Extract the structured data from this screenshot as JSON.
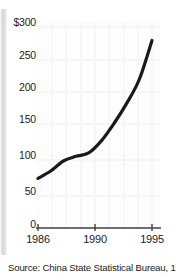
{
  "chart_data": {
    "type": "line",
    "title": "",
    "subtitle": "",
    "xlabel": "",
    "ylabel": "",
    "x": [
      1986,
      1987,
      1988,
      1989,
      1990,
      1991,
      1992,
      1993,
      1994,
      1995
    ],
    "values": [
      74,
      85,
      100,
      107,
      112,
      130,
      156,
      186,
      222,
      280
    ],
    "series": [
      {
        "name": "Total trade",
        "values": [
          74,
          85,
          100,
          107,
          112,
          130,
          156,
          186,
          222,
          280
        ]
      }
    ],
    "xlim": [
      1986,
      1995
    ],
    "ylim": [
      0,
      300
    ],
    "y_ticks": [
      0,
      50,
      100,
      150,
      200,
      250,
      300
    ],
    "y_tick_labels": [
      "0",
      "50",
      "100",
      "150",
      "200",
      "250",
      "$300"
    ],
    "x_ticks": [
      1986,
      1990,
      1995
    ],
    "x_tick_labels": [
      "1986",
      "1990",
      "1995"
    ],
    "grid": true,
    "grid_visible_faint": true,
    "legend": null,
    "legend_position": "none",
    "units": "billions of US dollars",
    "line_color": "#1a1a1a",
    "line_width": 3,
    "background_color": "#fdfdfd",
    "axis_color": "#4a4a4a"
  },
  "source": {
    "text": "Source:  China State Statistical Bureau, 1996"
  },
  "axes": {
    "y_labels": [
      {
        "text": "$300",
        "value": 300
      },
      {
        "text": "250",
        "value": 250
      },
      {
        "text": "200",
        "value": 200
      },
      {
        "text": "150",
        "value": 150
      },
      {
        "text": "100",
        "value": 100
      },
      {
        "text": "50",
        "value": 50
      },
      {
        "text": "0",
        "value": 0
      }
    ],
    "x_labels": [
      {
        "text": "1986",
        "value": 1986
      },
      {
        "text": "1990",
        "value": 1990
      },
      {
        "text": "1995",
        "value": 1995
      }
    ]
  }
}
